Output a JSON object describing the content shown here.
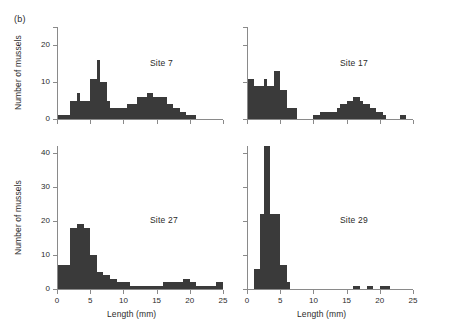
{
  "figure": {
    "panel_marker": "(b)",
    "shared_xlabel": "Length (mm)",
    "shared_ylabel": "Number of mussels",
    "bar_color": "#3a3a3a",
    "axis_color": "#8a8a8a"
  },
  "chart_data": [
    {
      "type": "bar",
      "title": "Site 7",
      "xlabel": "",
      "ylabel": "Number of mussels",
      "xlim": [
        0,
        25
      ],
      "ylim": [
        0,
        25
      ],
      "xticks": [
        0,
        5,
        10,
        15,
        20,
        25
      ],
      "xticklabels": [
        "",
        "",
        "",
        "",
        "",
        ""
      ],
      "yticks": [
        0,
        10,
        20,
        25
      ],
      "yticklabels": [
        "0",
        "10",
        "20",
        ""
      ],
      "grid": false,
      "bin_width": 0.5,
      "bin_starts": [
        0.0,
        0.5,
        1.0,
        1.5,
        2.0,
        2.5,
        3.0,
        3.5,
        4.0,
        4.5,
        5.0,
        5.5,
        6.0,
        6.5,
        7.0,
        7.5,
        8.0,
        8.5,
        9.0,
        9.5,
        10.0,
        10.5,
        11.0,
        11.5,
        12.0,
        12.5,
        13.0,
        13.5,
        14.0,
        14.5,
        15.0,
        15.5,
        16.0,
        16.5,
        17.0,
        17.5,
        18.0,
        18.5,
        19.0,
        19.5,
        20.0,
        20.5,
        21.0,
        21.5,
        22.0,
        22.5,
        23.0,
        23.5,
        24.0,
        24.5
      ],
      "values": [
        1,
        1,
        1,
        1,
        5,
        5,
        7,
        5,
        5,
        5,
        11,
        11,
        16,
        10,
        10,
        5,
        3,
        3,
        3,
        3,
        3,
        4,
        4,
        4,
        6,
        6,
        6,
        7,
        7,
        6,
        6,
        6,
        6,
        4,
        4,
        3,
        3,
        2,
        2,
        1,
        1,
        1,
        0,
        0,
        0,
        0,
        0,
        0,
        0,
        0
      ]
    },
    {
      "type": "bar",
      "title": "Site 17",
      "xlabel": "",
      "ylabel": "",
      "xlim": [
        0,
        25
      ],
      "ylim": [
        0,
        25
      ],
      "xticks": [
        0,
        5,
        10,
        15,
        20,
        25
      ],
      "xticklabels": [
        "",
        "",
        "",
        "",
        "",
        ""
      ],
      "yticks": [
        0,
        10,
        20,
        25
      ],
      "yticklabels": [
        "",
        "",
        "",
        ""
      ],
      "grid": false,
      "bin_width": 0.5,
      "bin_starts": [
        0.0,
        0.5,
        1.0,
        1.5,
        2.0,
        2.5,
        3.0,
        3.5,
        4.0,
        4.5,
        5.0,
        5.5,
        6.0,
        6.5,
        7.0,
        7.5,
        8.0,
        8.5,
        9.0,
        9.5,
        10.0,
        10.5,
        11.0,
        11.5,
        12.0,
        12.5,
        13.0,
        13.5,
        14.0,
        14.5,
        15.0,
        15.5,
        16.0,
        16.5,
        17.0,
        17.5,
        18.0,
        18.5,
        19.0,
        19.5,
        20.0,
        20.5,
        21.0,
        21.5,
        22.0,
        22.5,
        23.0,
        23.5,
        24.0,
        24.5
      ],
      "values": [
        11,
        11,
        9,
        9,
        9,
        11,
        9,
        9,
        13,
        13,
        8,
        8,
        3,
        3,
        3,
        0,
        0,
        0,
        0,
        0,
        1,
        1,
        2,
        2,
        2,
        2,
        2,
        3,
        4,
        4,
        5,
        5,
        6,
        6,
        5,
        4,
        4,
        3,
        3,
        2,
        2,
        1,
        0,
        0,
        0,
        0,
        1,
        1,
        0,
        0
      ]
    },
    {
      "type": "bar",
      "title": "Site 27",
      "xlabel": "Length (mm)",
      "ylabel": "Number of mussels",
      "xlim": [
        0,
        25
      ],
      "ylim": [
        0,
        42
      ],
      "xticks": [
        0,
        5,
        10,
        15,
        20,
        25
      ],
      "xticklabels": [
        "0",
        "5",
        "10",
        "15",
        "20",
        "25"
      ],
      "yticks": [
        0,
        10,
        20,
        30,
        40
      ],
      "yticklabels": [
        "0",
        "10",
        "20",
        "30",
        "40"
      ],
      "grid": false,
      "bin_width": 0.5,
      "bin_starts": [
        0.0,
        0.5,
        1.0,
        1.5,
        2.0,
        2.5,
        3.0,
        3.5,
        4.0,
        4.5,
        5.0,
        5.5,
        6.0,
        6.5,
        7.0,
        7.5,
        8.0,
        8.5,
        9.0,
        9.5,
        10.0,
        10.5,
        11.0,
        11.5,
        12.0,
        12.5,
        13.0,
        13.5,
        14.0,
        14.5,
        15.0,
        15.5,
        16.0,
        16.5,
        17.0,
        17.5,
        18.0,
        18.5,
        19.0,
        19.5,
        20.0,
        20.5,
        21.0,
        21.5,
        22.0,
        22.5,
        23.0,
        23.5,
        24.0,
        24.5
      ],
      "values": [
        7,
        7,
        7,
        7,
        18,
        18,
        19,
        19,
        18,
        18,
        10,
        10,
        5,
        5,
        4,
        4,
        3,
        3,
        2,
        2,
        2,
        2,
        1,
        1,
        1,
        1,
        1,
        1,
        1,
        1,
        1,
        1,
        2,
        2,
        2,
        2,
        2,
        2,
        3,
        3,
        2,
        2,
        1,
        1,
        1,
        1,
        1,
        1,
        2,
        2
      ]
    },
    {
      "type": "bar",
      "title": "Site 29",
      "xlabel": "Length (mm)",
      "ylabel": "",
      "xlim": [
        0,
        25
      ],
      "ylim": [
        0,
        42
      ],
      "xticks": [
        0,
        5,
        10,
        15,
        20,
        25
      ],
      "xticklabels": [
        "0",
        "5",
        "10",
        "15",
        "20",
        "25"
      ],
      "yticks": [
        0,
        10,
        20,
        30,
        40
      ],
      "yticklabels": [
        "",
        "",
        "",
        "",
        ""
      ],
      "grid": false,
      "bin_width": 0.5,
      "bin_starts": [
        0.0,
        0.5,
        1.0,
        1.5,
        2.0,
        2.5,
        3.0,
        3.5,
        4.0,
        4.5,
        5.0,
        5.5,
        6.0,
        6.5,
        7.0,
        7.5,
        8.0,
        8.5,
        9.0,
        9.5,
        10.0,
        10.5,
        11.0,
        11.5,
        12.0,
        12.5,
        13.0,
        13.5,
        14.0,
        14.5,
        15.0,
        15.5,
        16.0,
        16.5,
        17.0,
        17.5,
        18.0,
        18.5,
        19.0,
        19.5,
        20.0,
        20.5,
        21.0,
        21.5,
        22.0,
        22.5,
        23.0,
        23.5,
        24.0,
        24.5
      ],
      "values": [
        0,
        0,
        6,
        6,
        22,
        42,
        42,
        22,
        22,
        22,
        7,
        7,
        2,
        0,
        0,
        0,
        0,
        0,
        0,
        0,
        0,
        0,
        0,
        0,
        0,
        0,
        0,
        0,
        0,
        0,
        0,
        0,
        1,
        1,
        0,
        0,
        1,
        1,
        0,
        0,
        1,
        1,
        1,
        0,
        0,
        0,
        0,
        0,
        0,
        0
      ]
    }
  ]
}
